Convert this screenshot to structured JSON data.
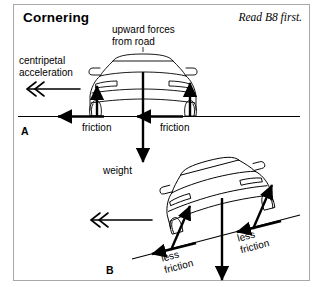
{
  "header": {
    "title": "Cornering",
    "note": "Read B8 first."
  },
  "diagram_a": {
    "panel_label": "A",
    "label_upward": "upward forces\nfrom road",
    "label_centripetal": "centripetal\nacceleration",
    "label_friction_left": "friction",
    "label_friction_right": "friction",
    "label_weight": "weight"
  },
  "diagram_b": {
    "panel_label": "B",
    "label_less_friction_left": "less\nfriction",
    "label_less_friction_right": "less\nfriction"
  },
  "colors": {
    "ink": "#000000",
    "frame": "#a8a8a8",
    "paper": "#ffffff"
  }
}
